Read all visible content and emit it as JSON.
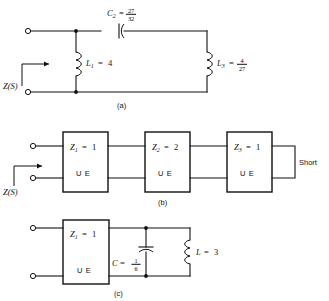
{
  "figure": {
    "background": "#ffffff",
    "ink": "#111111"
  },
  "panels": [
    {
      "id": "a",
      "caption": "(a)",
      "port_label": "Z(S)",
      "elements": [
        {
          "name": "C2",
          "symbol": "C",
          "subscript": "2",
          "eq": "=",
          "value_num": "27",
          "value_den": "32",
          "value_text": "27/32",
          "type": "capacitor",
          "orientation": "horizontal"
        },
        {
          "name": "L1",
          "symbol": "L",
          "subscript": "1",
          "eq": "=",
          "value_text": "4",
          "type": "inductor",
          "orientation": "vertical"
        },
        {
          "name": "L3",
          "symbol": "L",
          "subscript": "3",
          "eq": "=",
          "value_num": "4",
          "value_den": "27",
          "value_text": "4/27",
          "type": "inductor",
          "orientation": "vertical"
        }
      ]
    },
    {
      "id": "b",
      "caption": "(b)",
      "port_label": "Z(S)",
      "termination": "Short",
      "sections": [
        {
          "name": "Z1",
          "symbol": "Z",
          "subscript": "1",
          "eq": "=",
          "value_text": "1",
          "kind": "U E"
        },
        {
          "name": "Z2",
          "symbol": "Z",
          "subscript": "2",
          "eq": "=",
          "value_text": "2",
          "kind": "U E"
        },
        {
          "name": "Z3",
          "symbol": "Z",
          "subscript": "3",
          "eq": "=",
          "value_text": "1",
          "kind": "U E"
        }
      ]
    },
    {
      "id": "c",
      "caption": "(c)",
      "sections": [
        {
          "name": "Z1",
          "symbol": "Z",
          "subscript": "1",
          "eq": "=",
          "value_text": "1",
          "kind": "U E"
        }
      ],
      "elements": [
        {
          "name": "C",
          "symbol": "C",
          "eq": "=",
          "value_num": "1",
          "value_den": "6",
          "value_text": "1/6",
          "type": "capacitor",
          "orientation": "vertical"
        },
        {
          "name": "L",
          "symbol": "L",
          "eq": "=",
          "value_text": "3",
          "type": "inductor",
          "orientation": "vertical"
        }
      ]
    }
  ]
}
